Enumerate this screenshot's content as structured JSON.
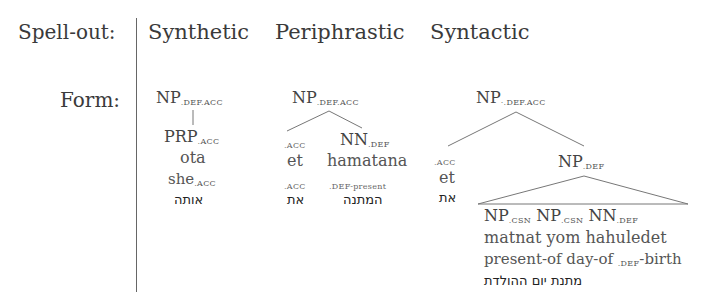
{
  "row_labels": {
    "spellout": "Spell-out:",
    "form": "Form:"
  },
  "columns": [
    {
      "header": "Synthetic",
      "root": {
        "cat": "NP",
        "feat": ".DEF.ACC"
      },
      "child": {
        "cat": "PRP",
        "feat": ".ACC"
      },
      "word": "ota",
      "gloss": {
        "text": "she",
        "feat": ".ACC"
      },
      "hebrew": "אותה"
    },
    {
      "header": "Periphrastic",
      "root": {
        "cat": "NP",
        "feat": ".DEF.ACC"
      },
      "left": {
        "feat": ".ACC",
        "word": "et",
        "gloss": ".ACC",
        "hebrew": "את"
      },
      "right": {
        "cat": "NN",
        "feat": ".DEF",
        "word": "hamatana",
        "gloss": ".DEF-present",
        "hebrew": "המתנה"
      }
    },
    {
      "header": "Syntactic",
      "root": {
        "cat": "NP",
        "feat": "·.DEF.ACC"
      },
      "left": {
        "feat": ".ACC",
        "word": "et",
        "hebrew": "את"
      },
      "mid": {
        "cat": "NP",
        "feat": ".DEF"
      },
      "leaves": [
        {
          "cat": "NP",
          "feat": ".CSN"
        },
        {
          "cat": "NP",
          "feat": ".CSN"
        },
        {
          "cat": "NN",
          "feat": ".DEF"
        }
      ],
      "words": "matnat yom hahuledet",
      "gloss_pre": "present-of day-of ",
      "gloss_feat": ".DEF",
      "gloss_post": "-birth",
      "hebrew": "מתנת יום ההולדת"
    }
  ]
}
